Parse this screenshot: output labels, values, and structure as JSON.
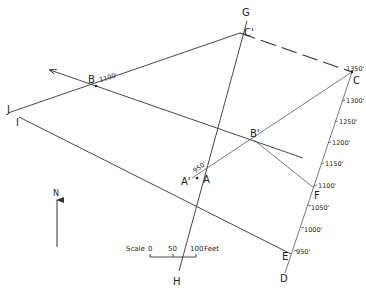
{
  "diagram": {
    "points": {
      "G": "G",
      "H": "H",
      "J": "J",
      "I": "I",
      "B": "B",
      "C_prime": "C'",
      "C": "C",
      "B_prime": "B'",
      "A": "A",
      "A_prime": "A'",
      "F": "F",
      "E": "E",
      "D": "D"
    },
    "point_elevations": {
      "B": "1100'",
      "C": "1350'",
      "A": "950'"
    },
    "contour_ticks": [
      "1300'",
      "1250'",
      "1200'",
      "1150'",
      "1100'",
      "1050'",
      "1000'",
      "950'"
    ],
    "north_arrow": {
      "label": "N"
    },
    "scale": {
      "label": "Scale",
      "ticks": [
        "0",
        "50",
        "100"
      ],
      "unit": "Feet"
    },
    "colors": {
      "line": "#333333",
      "background": "#ffffff"
    }
  }
}
